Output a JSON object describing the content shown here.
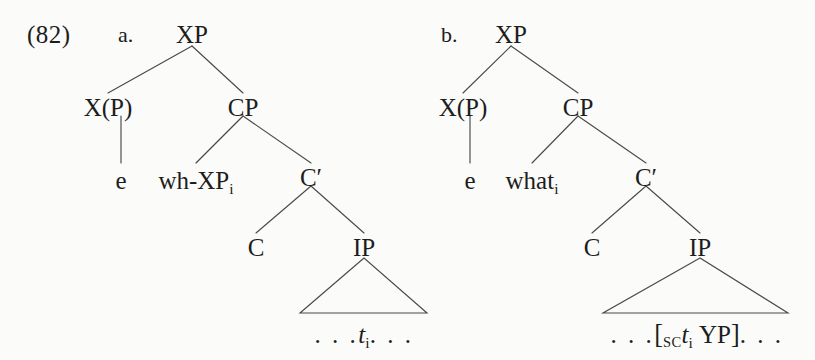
{
  "figure": {
    "example_number": "(82)",
    "background_color": "#fbfbf9",
    "ink_color": "#1d1d1d",
    "line_color": "#4a4a4a"
  },
  "trees": [
    {
      "letter": "a.",
      "nodes": {
        "root": "XP",
        "left_head": "X(P)",
        "left_head_child": "e",
        "cp": "CP",
        "specifier": "wh-XP",
        "specifier_index": "i",
        "cbar": "C′",
        "c": "C",
        "ip": "IP"
      },
      "triangle_text": {
        "leading_dots": ". . .",
        "trace": "t",
        "trace_index": "i",
        "trailing_dots": ". . ."
      }
    },
    {
      "letter": "b.",
      "nodes": {
        "root": "XP",
        "left_head": "X(P)",
        "left_head_child": "e",
        "cp": "CP",
        "specifier": "what",
        "specifier_index": "i",
        "cbar": "C′",
        "c": "C",
        "ip": "IP"
      },
      "triangle_text": {
        "leading_dots": ". . .",
        "open_bracket": "[",
        "bracket_subscript": "SC",
        "trace": "t",
        "trace_index": "i",
        "phrase": "YP",
        "close_bracket": "]",
        "trailing_dots": ". . ."
      }
    }
  ]
}
